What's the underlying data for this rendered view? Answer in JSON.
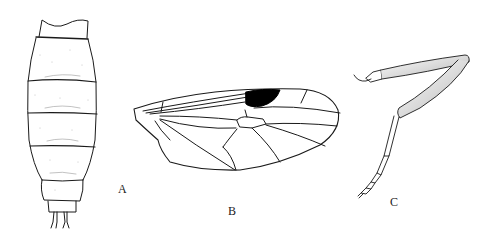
{
  "figure": {
    "panels": [
      {
        "id": "A",
        "label": "A",
        "subject": "abdomen-dorsal-view"
      },
      {
        "id": "B",
        "label": "B",
        "subject": "wing"
      },
      {
        "id": "C",
        "label": "C",
        "subject": "leg"
      }
    ],
    "colors": {
      "ink": "#1a1a1a",
      "stipple": "#9a9a9a",
      "background": "#ffffff",
      "stigma": "#000000"
    }
  }
}
